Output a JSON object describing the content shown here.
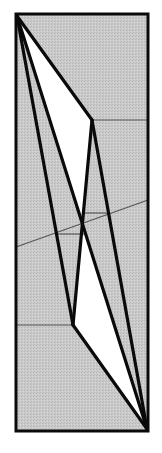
{
  "figure": {
    "kind": "geometric-fold-diagram",
    "width": 162,
    "height": 453,
    "colors": {
      "background": "#ffffff",
      "fill": "#c9c9c9",
      "stroke": "#0a0a0a",
      "thin_stroke": "#555555",
      "white_region": "#ffffff"
    },
    "frame": {
      "x": 16,
      "y": 14,
      "w": 132,
      "h": 417
    },
    "vertices": {
      "A": [
        17,
        16
      ],
      "B": [
        147,
        429
      ],
      "P": [
        92,
        120
      ],
      "Q": [
        73,
        325
      ]
    },
    "thick_edges": [
      [
        "A",
        "P"
      ],
      [
        "P",
        "Q"
      ],
      [
        "A",
        "Q"
      ],
      [
        "A",
        "B"
      ],
      [
        "P",
        "B"
      ],
      [
        "Q",
        "B"
      ]
    ],
    "thin_lines": [
      {
        "x1": 92,
        "y1": 120,
        "x2": 148,
        "y2": 120
      },
      {
        "x1": 16,
        "y1": 325,
        "x2": 73,
        "y2": 325
      },
      {
        "x1": 16,
        "y1": 247,
        "x2": 148,
        "y2": 200
      },
      {
        "x1": 82,
        "y1": 213,
        "x2": 108,
        "y2": 213
      },
      {
        "x1": 58,
        "y1": 234,
        "x2": 84,
        "y2": 234
      }
    ]
  }
}
